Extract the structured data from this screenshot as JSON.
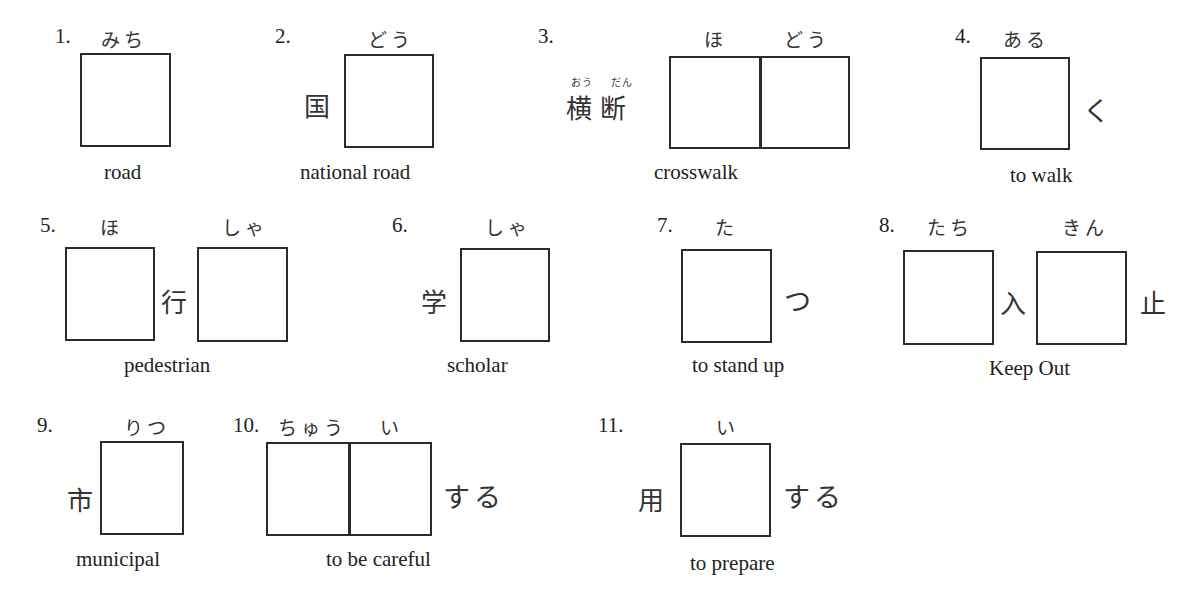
{
  "worksheet": {
    "items": [
      {
        "number": "1.",
        "readings": [
          "みち"
        ],
        "given_before": "",
        "given_between": "",
        "given_after": "",
        "meaning": "road",
        "answer_boxes": 1
      },
      {
        "number": "2.",
        "readings": [
          "どう"
        ],
        "given_before": "国",
        "given_between": "",
        "given_after": "",
        "meaning": "national road",
        "answer_boxes": 1
      },
      {
        "number": "3.",
        "readings": [
          "ほ",
          "どう"
        ],
        "given_before": "横断",
        "given_before_furigana": [
          "おう",
          "だん"
        ],
        "given_between": "",
        "given_after": "",
        "meaning": "crosswalk",
        "answer_boxes": 2
      },
      {
        "number": "4.",
        "readings": [
          "ある"
        ],
        "given_before": "",
        "given_between": "",
        "given_after": "く",
        "meaning": "to walk",
        "answer_boxes": 1
      },
      {
        "number": "5.",
        "readings": [
          "ほ",
          "しゃ"
        ],
        "given_before": "",
        "given_between": "行",
        "given_after": "",
        "meaning": "pedestrian",
        "answer_boxes": 2
      },
      {
        "number": "6.",
        "readings": [
          "しゃ"
        ],
        "given_before": "学",
        "given_between": "",
        "given_after": "",
        "meaning": "scholar",
        "answer_boxes": 1
      },
      {
        "number": "7.",
        "readings": [
          "た"
        ],
        "given_before": "",
        "given_between": "",
        "given_after": "つ",
        "meaning": "to stand up",
        "answer_boxes": 1
      },
      {
        "number": "8.",
        "readings": [
          "たち",
          "きん"
        ],
        "given_before": "",
        "given_between": "入",
        "given_after": "止",
        "meaning": "Keep Out",
        "answer_boxes": 2
      },
      {
        "number": "9.",
        "readings": [
          "りつ"
        ],
        "given_before": "市",
        "given_between": "",
        "given_after": "",
        "meaning": "municipal",
        "answer_boxes": 1
      },
      {
        "number": "10.",
        "readings": [
          "ちゅう",
          "い"
        ],
        "given_before": "",
        "given_between": "",
        "given_after": "する",
        "meaning": "to be careful",
        "answer_boxes": 2
      },
      {
        "number": "11.",
        "readings": [
          "い"
        ],
        "given_before": "用",
        "given_between": "",
        "given_after": "する",
        "meaning": "to prepare",
        "answer_boxes": 1
      }
    ]
  }
}
